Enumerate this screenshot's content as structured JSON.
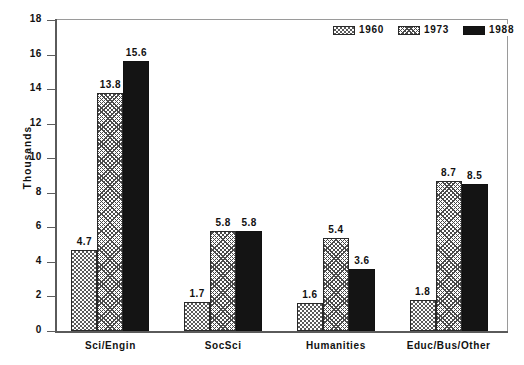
{
  "chart_data": {
    "type": "bar",
    "title": "",
    "xlabel": "",
    "ylabel": "Thousands",
    "ylim": [
      0,
      18
    ],
    "ytick_step": 2,
    "yticks": [
      "18",
      "16",
      "14",
      "12",
      "10",
      "8",
      "6",
      "4",
      "2",
      "0"
    ],
    "grid": false,
    "legend_position": "top-right",
    "categories": [
      "Sci/Engin",
      "SocSci",
      "Humanities",
      "Educ/Bus/Other"
    ],
    "series": [
      {
        "name": "1960",
        "pattern": "checker-dot",
        "color": "#5a5a5a",
        "values": [
          4.7,
          1.7,
          1.6,
          1.8
        ],
        "labels": [
          "4.7",
          "1.7",
          "1.6",
          "1.8"
        ]
      },
      {
        "name": "1973",
        "pattern": "diagonal-crosshatch",
        "color": "#4a4a4a",
        "values": [
          13.8,
          5.8,
          5.4,
          8.7
        ],
        "labels": [
          "13.8",
          "5.8",
          "5.4",
          "8.7"
        ]
      },
      {
        "name": "1988",
        "pattern": "solid",
        "color": "#141414",
        "values": [
          15.6,
          5.8,
          3.6,
          8.5
        ],
        "labels": [
          "15.6",
          "5.8",
          "3.6",
          "8.5"
        ]
      }
    ]
  },
  "axis": {
    "y_title": "Thousands"
  },
  "legend": {
    "items": [
      {
        "label": "1960"
      },
      {
        "label": "1973"
      },
      {
        "label": "1988"
      }
    ]
  }
}
